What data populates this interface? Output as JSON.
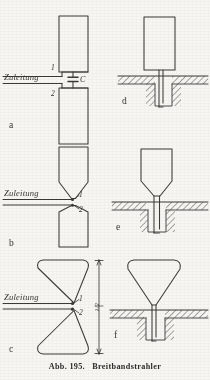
{
  "figure": {
    "caption_label": "Abb. 195.",
    "caption_title": "Breitbandstrahler",
    "ink_color": "#3a3835",
    "paper_color": "#fbfaf7",
    "hatch_color": "#4a4845"
  },
  "panels": {
    "a": {
      "letter": "a",
      "feed_label": "Zuleitung",
      "terminal_upper": "1",
      "terminal_lower": "2",
      "component_label": "C",
      "component_name": "capacitor",
      "shape": "two stacked rectangles fed at center gap through a capacitor"
    },
    "b": {
      "letter": "b",
      "feed_label": "Zuleitung",
      "terminal_upper": "1",
      "terminal_lower": "2",
      "shape": "two tapered rectangles with pointed tips meeting at feed gap"
    },
    "c": {
      "letter": "c",
      "feed_label": "Zuleitung",
      "terminal_upper": "1",
      "terminal_lower": "2",
      "dimension_label": "λ/2",
      "shape": "bowtie / hourglass radiator with rounded outer edges"
    },
    "d": {
      "letter": "d",
      "shape": "rectangular monopole above hatched ground plane with coaxial feed in cavity"
    },
    "e": {
      "letter": "e",
      "shape": "tapered monopole above hatched ground plane with coaxial feed in cavity"
    },
    "f": {
      "letter": "f",
      "shape": "triangular / funnel monopole above hatched ground plane with coaxial feed in cavity"
    }
  }
}
